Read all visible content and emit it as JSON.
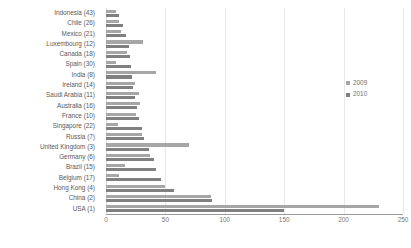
{
  "chart_data": {
    "type": "bar",
    "orientation": "horizontal",
    "title": "",
    "xlabel": "",
    "ylabel": "",
    "xlim": [
      0,
      250
    ],
    "xticks": [
      0,
      50,
      100,
      150,
      200,
      250
    ],
    "grid": true,
    "legend_position": "right",
    "categories": [
      "Indonesia (43)",
      "Chile (26)",
      "Mexico (21)",
      "Luxembourg (12)",
      "Canada (18)",
      "Spain (30)",
      "India (8)",
      "Ireland (14)",
      "Saudi Arabia (11)",
      "Australia (16)",
      "France (10)",
      "Singapore (22)",
      "Russia (7)",
      "United Kingdom (3)",
      "Germany (6)",
      "Brazil (15)",
      "Belgium (17)",
      "Hong Kong (4)",
      "China (2)",
      "USA (1)"
    ],
    "series": [
      {
        "name": "2009",
        "color": "#a6a6a6",
        "values": [
          8,
          11,
          13,
          31,
          18,
          8,
          42,
          24,
          28,
          29,
          25,
          10,
          30,
          70,
          37,
          16,
          11,
          50,
          88,
          230
        ]
      },
      {
        "name": "2010",
        "color": "#808080",
        "values": [
          11,
          14,
          17,
          19,
          20,
          21,
          22,
          23,
          24,
          26,
          28,
          30,
          32,
          36,
          40,
          42,
          46,
          57,
          89,
          150
        ]
      }
    ]
  },
  "legend": {
    "items": [
      {
        "label": "2009",
        "color": "#a6a6a6"
      },
      {
        "label": "2010",
        "color": "#808080"
      }
    ]
  },
  "axis": {
    "tick_labels": [
      "0",
      "50",
      "100",
      "150",
      "200",
      "250"
    ]
  }
}
